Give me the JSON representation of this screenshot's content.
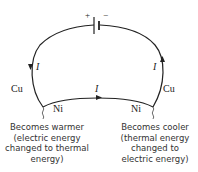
{
  "diagram": {
    "battery": {
      "plus": "+",
      "minus": "−"
    },
    "current_label": "I",
    "left_wire": "Cu",
    "right_wire": "Cu",
    "bottom_left_wire": "Ni",
    "bottom_right_wire": "Ni",
    "left_caption": [
      "Becomes warmer",
      "(electric energy",
      "changed to thermal",
      "energy)"
    ],
    "right_caption": [
      "Becomes cooler",
      "(thermal energy",
      "changed to",
      "electric energy)"
    ]
  }
}
